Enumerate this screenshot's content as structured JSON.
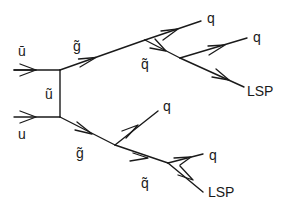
{
  "diagram": {
    "type": "feynman-diagram",
    "incoming": {
      "top": {
        "label": "ū",
        "particle": "anti-up quark"
      },
      "bottom": {
        "label": "u",
        "particle": "up quark"
      }
    },
    "propagator": {
      "label": "ũ",
      "particle": "up squark"
    },
    "upper_branch": {
      "gluino": {
        "label": "g̃"
      },
      "quark_1": {
        "label": "q"
      },
      "squark": {
        "label": "q̃"
      },
      "quark_2": {
        "label": "q"
      },
      "lsp": {
        "label": "LSP"
      }
    },
    "lower_branch": {
      "gluino": {
        "label": "g̃"
      },
      "quark_1": {
        "label": "q"
      },
      "squark": {
        "label": "q̃"
      },
      "quark_2": {
        "label": "q"
      },
      "lsp": {
        "label": "LSP"
      }
    }
  }
}
